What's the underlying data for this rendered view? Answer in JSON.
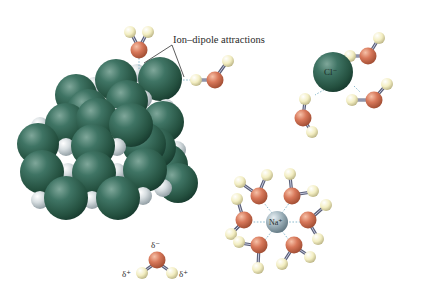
{
  "figure": {
    "type": "diagram",
    "annotation": {
      "text": "Ion–dipole attractions",
      "leader_lines": 2
    },
    "ions": {
      "chloride": {
        "label": "Cl⁻",
        "color": "#2f6353",
        "hydrating_waters": 4,
        "orientation": "H toward ion"
      },
      "sodium": {
        "label": "Na⁺",
        "color": "#9fb3bd",
        "hydrating_waters": 8,
        "orientation": "O toward ion"
      }
    },
    "crystal": {
      "name": "NaCl lattice",
      "large_sphere_color": "#2e6252",
      "small_sphere_color": "#d6dde0"
    },
    "water_key": {
      "oxygen_charge": "δ⁻",
      "hydrogen_charge_left": "δ⁺",
      "hydrogen_charge_right": "δ⁺",
      "oxygen_color": "#d2795a",
      "hydrogen_color": "#f3eec2"
    }
  }
}
